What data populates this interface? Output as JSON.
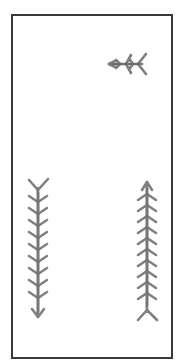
{
  "panel": {
    "description": "Scanned line drawing of three fishbone/arrow figures inside a rectangular frame",
    "stroke_color": "#7a7a7a",
    "frame_color": "#3a3a3a",
    "background": "#ffffff"
  },
  "figures": [
    {
      "id": "top-right-arrow",
      "orientation": "horizontal",
      "pointing": "left",
      "segments": 3
    },
    {
      "id": "left-arrow",
      "orientation": "vertical",
      "pointing": "down",
      "segments": 10
    },
    {
      "id": "right-arrow",
      "orientation": "vertical",
      "pointing": "up",
      "segments": 12
    }
  ]
}
